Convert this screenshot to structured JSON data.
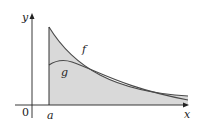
{
  "figure": {
    "labels": {
      "y_axis": "y",
      "x_axis": "x",
      "origin": "0",
      "a": "a",
      "f": "f",
      "g": "g"
    },
    "colors": {
      "fill": "#d9d9d9",
      "curve": "#4a4a4a",
      "axis": "#222222"
    }
  }
}
